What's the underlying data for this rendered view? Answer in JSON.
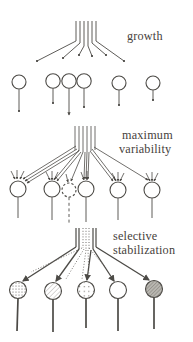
{
  "figure": {
    "background_color": "#ffffff",
    "line_color": "#4c4a46",
    "text_color": "#46423c"
  },
  "stages": {
    "growth": {
      "label": "growth"
    },
    "variability": {
      "label_line1": "maximum",
      "label_line2": "variability"
    },
    "stabilization": {
      "label_line1": "selective",
      "label_line2": "stabilization"
    }
  },
  "neuron_rows": {
    "row1_count": 6,
    "row2_count": 6,
    "row2_transient_style": "dashed-outline",
    "row3_count": 5,
    "row3_fills": [
      "stippled",
      "light-hatch",
      "sparse-dots",
      "empty",
      "dense-hatch-gray"
    ]
  }
}
